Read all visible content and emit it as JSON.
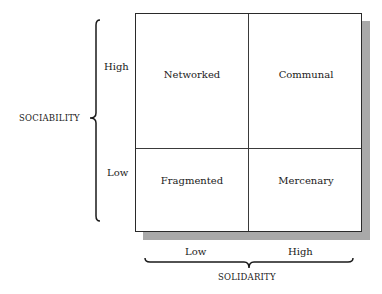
{
  "diagram": {
    "type": "2x2 matrix",
    "y_axis": {
      "title": "SOCIABILITY",
      "high_label": "High",
      "low_label": "Low"
    },
    "x_axis": {
      "title": "SOLIDARITY",
      "low_label": "Low",
      "high_label": "High"
    },
    "quadrants": {
      "top_left": "Networked",
      "top_right": "Communal",
      "bottom_left": "Fragmented",
      "bottom_right": "Mercenary"
    },
    "colors": {
      "border": "#2a2a2a",
      "shadow": "#a9a9a9",
      "background": "#ffffff"
    }
  }
}
